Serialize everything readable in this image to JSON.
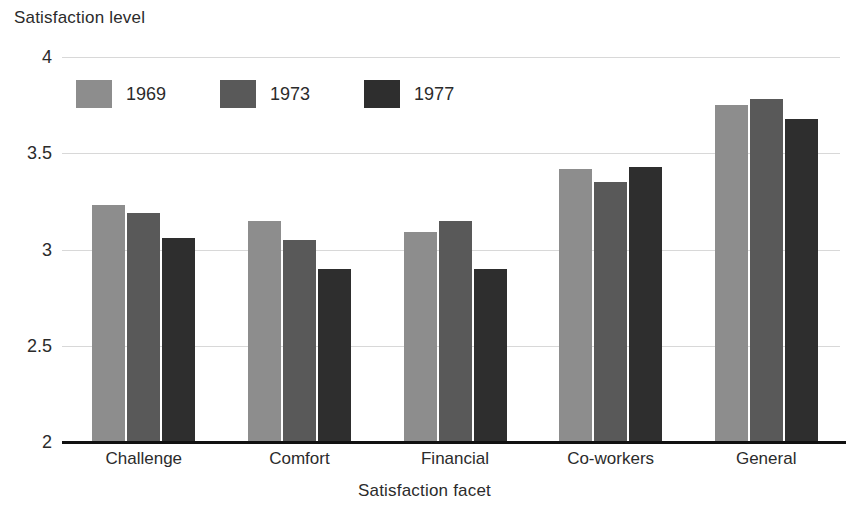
{
  "chart_data": {
    "type": "bar",
    "title": "",
    "xlabel": "Satisfaction facet",
    "ylabel": "Satisfaction level",
    "categories": [
      "Challenge",
      "Comfort",
      "Financial",
      "Co-workers",
      "General"
    ],
    "series": [
      {
        "name": "1969",
        "color": "#8d8d8d",
        "values": [
          3.23,
          3.15,
          3.09,
          3.42,
          3.75
        ]
      },
      {
        "name": "1973",
        "color": "#595959",
        "values": [
          3.19,
          3.05,
          3.15,
          3.35,
          3.78
        ]
      },
      {
        "name": "1977",
        "color": "#2e2e2e",
        "values": [
          3.06,
          2.9,
          2.9,
          3.43,
          3.68
        ]
      }
    ],
    "ylim": [
      2,
      4
    ],
    "yticks": [
      2,
      2.5,
      3,
      3.5,
      4
    ],
    "ytick_labels": [
      "2",
      "2.5",
      "3",
      "3.5",
      "4"
    ],
    "grid": true,
    "legend_position": "upper-left-inside",
    "background": "#ffffff",
    "gridline_color": "#d8d8d8",
    "axis_color": "#111111"
  }
}
